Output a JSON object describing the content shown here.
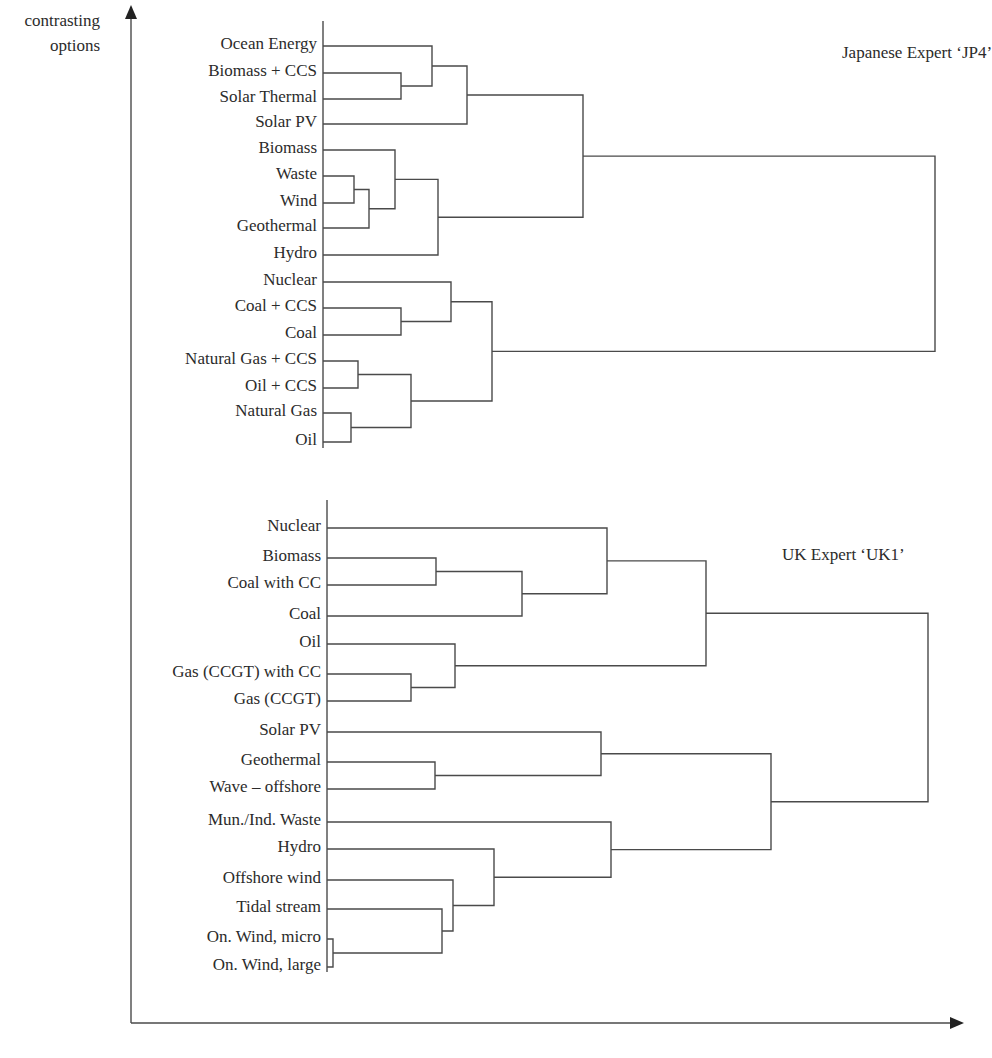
{
  "chart_data": {
    "type": "dendrogram",
    "y_axis_label": [
      "contrasting",
      "options"
    ],
    "x_axis_label": "",
    "dendrograms": [
      {
        "id": "jp4",
        "title": "Japanese Expert ‘JP4’",
        "title_pos": [
          842,
          55
        ],
        "baseline_x": 323,
        "baseline_y": [
          21,
          448
        ],
        "leaves": [
          {
            "label": "Ocean Energy",
            "y": 46
          },
          {
            "label": "Biomass + CCS",
            "y": 73
          },
          {
            "label": "Solar Thermal",
            "y": 99
          },
          {
            "label": "Solar PV",
            "y": 124
          },
          {
            "label": "Biomass",
            "y": 150
          },
          {
            "label": "Waste",
            "y": 176
          },
          {
            "label": "Wind",
            "y": 203
          },
          {
            "label": "Geothermal",
            "y": 228
          },
          {
            "label": "Hydro",
            "y": 255
          },
          {
            "label": "Nuclear",
            "y": 282
          },
          {
            "label": "Coal + CCS",
            "y": 308
          },
          {
            "label": "Coal",
            "y": 335
          },
          {
            "label": "Natural Gas + CCS",
            "y": 361
          },
          {
            "label": "Oil + CCS",
            "y": 388
          },
          {
            "label": "Natural Gas",
            "y": 413
          },
          {
            "label": "Oil",
            "y": 442
          }
        ],
        "merges": [
          {
            "a": "L1",
            "b": "L2",
            "x": 401,
            "y": 86
          },
          {
            "a": "L0",
            "b": "M0",
            "x": 432,
            "y": 66
          },
          {
            "a": "M1",
            "b": "L3",
            "x": 467,
            "y": 95
          },
          {
            "a": "L5",
            "b": "L6",
            "x": 354,
            "y": 189
          },
          {
            "a": "M3",
            "b": "L7",
            "x": 369,
            "y": 208
          },
          {
            "a": "L4",
            "b": "M4",
            "x": 395,
            "y": 181
          },
          {
            "a": "M5",
            "b": "L8",
            "x": 438,
            "y": 219
          },
          {
            "a": "M2",
            "b": "M6",
            "x": 583,
            "y": 157
          },
          {
            "a": "L10",
            "b": "L11",
            "x": 401,
            "y": 322
          },
          {
            "a": "L9",
            "b": "M8",
            "x": 451,
            "y": 302
          },
          {
            "a": "L12",
            "b": "L13",
            "x": 358,
            "y": 374
          },
          {
            "a": "L14",
            "b": "L15",
            "x": 351,
            "y": 426
          },
          {
            "a": "M10",
            "b": "M11",
            "x": 411,
            "y": 401
          },
          {
            "a": "M9",
            "b": "M12",
            "x": 492,
            "y": 351
          },
          {
            "a": "M7",
            "b": "M13",
            "x": 935,
            "y": 256
          }
        ]
      },
      {
        "id": "uk1",
        "title": "UK Expert ‘UK1’",
        "title_pos": [
          782,
          557
        ],
        "baseline_x": 327,
        "baseline_y": [
          500,
          972
        ],
        "leaves": [
          {
            "label": "Nuclear",
            "y": 528
          },
          {
            "label": "Biomass",
            "y": 558
          },
          {
            "label": "Coal with CC",
            "y": 585
          },
          {
            "label": "Coal",
            "y": 616
          },
          {
            "label": "Oil",
            "y": 644
          },
          {
            "label": "Gas (CCGT) with CC",
            "y": 674
          },
          {
            "label": "Gas (CCGT)",
            "y": 701
          },
          {
            "label": "Solar PV",
            "y": 732
          },
          {
            "label": "Geothermal",
            "y": 762
          },
          {
            "label": "Wave – offshore",
            "y": 789
          },
          {
            "label": "Mun./Ind. Waste",
            "y": 822
          },
          {
            "label": "Hydro",
            "y": 849
          },
          {
            "label": "Offshore wind",
            "y": 880
          },
          {
            "label": "Tidal stream",
            "y": 909
          },
          {
            "label": "On. Wind, micro",
            "y": 939
          },
          {
            "label": "On. Wind, large",
            "y": 967
          }
        ],
        "merges": [
          {
            "a": "L1",
            "b": "L2",
            "x": 436,
            "y": 572
          },
          {
            "a": "M0",
            "b": "L3",
            "x": 522,
            "y": 595
          },
          {
            "a": "L0",
            "b": "M1",
            "x": 607,
            "y": 562
          },
          {
            "a": "L5",
            "b": "L6",
            "x": 411,
            "y": 688
          },
          {
            "a": "L4",
            "b": "M3",
            "x": 455,
            "y": 667
          },
          {
            "a": "M2",
            "b": "M4",
            "x": 706,
            "y": 616
          },
          {
            "a": "L8",
            "b": "L9",
            "x": 435,
            "y": 778
          },
          {
            "a": "L7",
            "b": "M6",
            "x": 601,
            "y": 756
          },
          {
            "a": "L14",
            "b": "L15",
            "x": 333,
            "y": 952
          },
          {
            "a": "L13",
            "b": "M8",
            "x": 442,
            "y": 929
          },
          {
            "a": "L12",
            "b": "M9",
            "x": 453,
            "y": 906
          },
          {
            "a": "L11",
            "b": "M10",
            "x": 494,
            "y": 878
          },
          {
            "a": "L10",
            "b": "M11",
            "x": 611,
            "y": 849
          },
          {
            "a": "M7",
            "b": "M12",
            "x": 771,
            "y": 803
          },
          {
            "a": "M5",
            "b": "M13",
            "x": 928,
            "y": 710
          }
        ]
      }
    ],
    "axes": {
      "origin": [
        131,
        1023
      ],
      "y_top": 5,
      "x_right": 964
    }
  }
}
